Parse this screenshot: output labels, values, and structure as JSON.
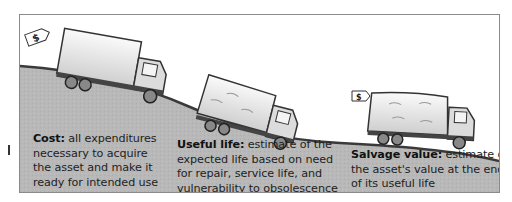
{
  "figure": {
    "stages": [
      {
        "id": "cost",
        "term": "Cost:",
        "description": "all expenditures necessary to acquire the asset and make it ready for intended use",
        "lines": [
          "all expenditures",
          "necessary to acquire",
          "the asset and make it",
          "ready for intended use"
        ],
        "price_tag": "$"
      },
      {
        "id": "useful-life",
        "term": "Useful life:",
        "description": "estimate of the expected life based on need for repair, service life, and vulnerability to obsolescence",
        "lines": [
          "estimate of the",
          "expected life based on need",
          "for repair, service life, and",
          "vulnerability to obsolescence"
        ]
      },
      {
        "id": "salvage-value",
        "term": "Salvage value:",
        "description": "estimate of the asset's value at the end of its useful life",
        "lines": [
          "estimate of",
          "the asset's value at the end",
          "of its useful life"
        ],
        "price_tag": "$"
      }
    ],
    "colors": {
      "hill": "#b4b4b4",
      "hill_edge": "#3a3a3a",
      "frame": "#8a8a8a",
      "text": "#1e1e1e"
    }
  }
}
